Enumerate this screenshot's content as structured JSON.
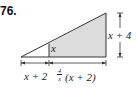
{
  "problem_number": "76.",
  "figure": {
    "type": "right-triangle-with-shaded-trapezoid",
    "colors": {
      "shade": "#dcdcdc",
      "stroke": "#333333"
    },
    "labels": {
      "inner_height": "x",
      "left_base": "x + 2",
      "right_base_coef_num": "4",
      "right_base_coef_den": "x",
      "right_base_rest": "(x + 2)",
      "height": "x + 4"
    }
  }
}
